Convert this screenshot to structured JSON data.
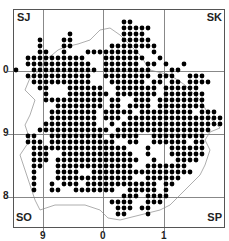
{
  "map": {
    "type": "distribution-dot-map",
    "frame": {
      "x": 13,
      "y": 9,
      "w": 211,
      "h": 218
    },
    "grid_lines": {
      "vertical_x": [
        43,
        103,
        164
      ],
      "horizontal_y": [
        71,
        134,
        197
      ],
      "color": "#888888"
    },
    "square_labels": [
      {
        "text": "SJ",
        "x": 17,
        "y": 12
      },
      {
        "text": "SK",
        "x": 206,
        "y": 12
      },
      {
        "text": "SO",
        "x": 16,
        "y": 212
      },
      {
        "text": "SP",
        "x": 206,
        "y": 212
      }
    ],
    "axis_labels": {
      "left": [
        {
          "text": "0",
          "y": 71
        },
        {
          "text": "9",
          "y": 134
        },
        {
          "text": "8",
          "y": 197
        }
      ],
      "bottom": [
        {
          "text": "9",
          "x": 43
        },
        {
          "text": "0",
          "x": 103
        },
        {
          "text": "1",
          "x": 164
        }
      ]
    },
    "dots": {
      "origin_x": 16,
      "origin_y": 22,
      "spacing": 6,
      "radius": 2.4,
      "color": "#000000",
      "rows": [
        "                  ##                ",
        "                  #####             ",
        "         #        ####              ",
        "    #   ##        #####             ",
        "    #   ##      ########            ",
        "    ##  #   #########  #            ",
        "  ##########   #######  #           ",
        "  ###########  ###### ## #  #       ",
        "#  ########### ########   ##        ",
        "  ###########  ######## ###  ###    ",
        "   ##########   ###### ## ## ####   ",
        "    ##   ######  ####### ######     ",
        "     #   ####### ####### #######    ",
        "     ########## ##  ### ########    ",
        "       ######## ## #### ########    ",
        "      ######## ##### ######### ###  ",
        "      ######## ### ################ ",
        "     #########  # #################  ",
        "    ############ ################    ",
        "  ##  ######### #####  #########     ",
        "  ### ###########  ##  ###### ##     ",
        "   ################   #   ######     ",
        "   ###  ############  #   ######     ",
        "   ### ##############  #   ####      ",
        "   ##  #############  #######        ",
        "   #   ####  #################       ",
        "   #   #############  ######         ",
        "   #  # ### ############ ##          ",
        "   #  ##  #######  ##### #           ",
        "                  ### ####           ",
        "                ####  ###            ",
        "                 ### ##              ",
        "                 ##   #              "
      ]
    },
    "boundary": {
      "color": "#999999",
      "points": "40,70 45,60 52,55 58,50 65,47 78,44 90,40 100,30 110,28 120,35 130,45 140,55 150,70 158,72 170,75 185,85 200,100 212,120 220,128 210,132 205,140 210,150 205,165 200,175 190,185 180,195 170,205 160,210 140,215 120,220 108,218 100,210 85,205 70,205 55,205 40,210 35,200 30,185 25,170 20,155 30,140 25,125 30,115 35,100 25,90 30,78 40,70"
    }
  }
}
